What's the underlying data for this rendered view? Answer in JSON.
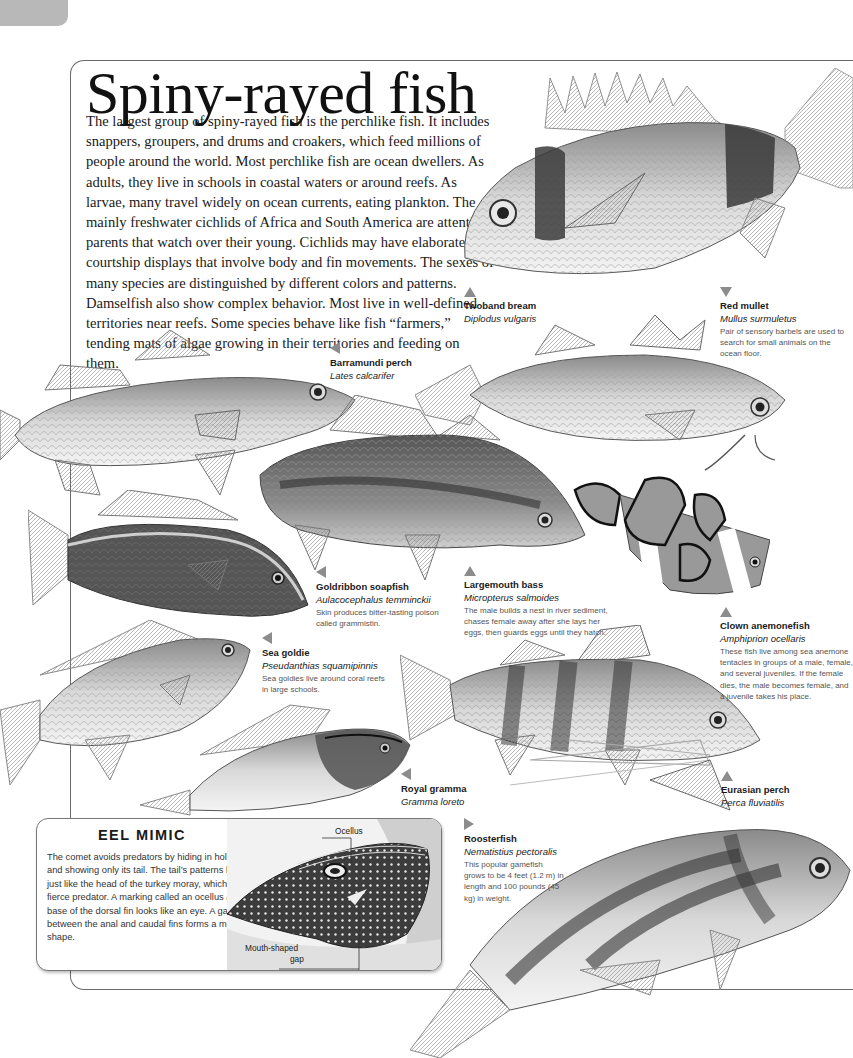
{
  "page": {
    "number": ""
  },
  "header": {
    "title": "Spiny-rayed fish"
  },
  "intro": {
    "text": "The largest group of spiny-rayed fish is the perchlike fish. It includes snappers, groupers, and drums and croakers, which feed millions of people around the world. Most perchlike fish are ocean dwellers. As adults, they live in schools in coastal waters or around reefs. As larvae, many travel widely on ocean currents, eating plankton. The mainly freshwater cichlids of Africa and South America are attentive parents that watch over their young. Cichlids may have elaborate courtship displays that involve body and fin movements. The sexes of many species are distinguished by different colors and patterns. Damselfish also show complex behavior. Most live in well-defined territories near reefs. Some species behave like fish “farmers,” tending mats of algae growing in their territories and feeding on them."
  },
  "species": [
    {
      "common": "Twoband bream",
      "scientific": "Diplodus vulgaris",
      "description": "",
      "arrow": "up"
    },
    {
      "common": "Red mullet",
      "scientific": "Mullus surmuletus",
      "description": "Pair of sensory barbels are used to search for small animals on the ocean floor.",
      "arrow": "down"
    },
    {
      "common": "Barramundi perch",
      "scientific": "Lates calcarifer",
      "description": "",
      "arrow": "left"
    },
    {
      "common": "Goldribbon soapfish",
      "scientific": "Aulacocephalus temminckii",
      "description": "Skin produces bitter-tasting poison called grammistin.",
      "arrow": "left"
    },
    {
      "common": "Largemouth bass",
      "scientific": "Micropterus salmoides",
      "description": "The male builds a nest in river sediment, chases female away after she lays her eggs, then guards eggs until they hatch.",
      "arrow": "up"
    },
    {
      "common": "Sea goldie",
      "scientific": "Pseudanthias squamipinnis",
      "description": "Sea goldies live around coral reefs in large schools.",
      "arrow": "left"
    },
    {
      "common": "Clown anemonefish",
      "scientific": "Amphiprion ocellaris",
      "description": "These fish live among sea anemone tentacles in groups of a male, female, and several juveniles. If the female dies, the male becomes female, and a juvenile takes his place.",
      "arrow": "up"
    },
    {
      "common": "Royal gramma",
      "scientific": "Gramma loreto",
      "description": "",
      "arrow": "left"
    },
    {
      "common": "Roosterfish",
      "scientific": "Nematistius pectoralis",
      "description": "This popular gamefish grows to be 4 feet (1.2 m) in length and 100 pounds (45 kg) in weight.",
      "arrow": "right"
    },
    {
      "common": "Eurasian perch",
      "scientific": "Perca fluviatilis",
      "description": "",
      "arrow": "up"
    }
  ],
  "eel_mimic": {
    "title": "EEL MIMIC",
    "text": "The comet avoids predators by hiding in holes and showing only its tail. The tail’s patterns look just like the head of the turkey moray, which is a fierce predator. A marking called an ocellus at the base of the dorsal fin looks like an eye. A gap between the anal and caudal fins forms a mouth shape.",
    "labels": {
      "ocellus": "Ocellus",
      "mouth_line1": "Mouth-shaped",
      "mouth_line2": "gap"
    }
  },
  "colors": {
    "frame": "#6a6a6a",
    "arrow": "#8c8c8c",
    "page_tab": "#b8b8b8",
    "body_text": "#1a1a1a",
    "desc_text": "#555555"
  }
}
